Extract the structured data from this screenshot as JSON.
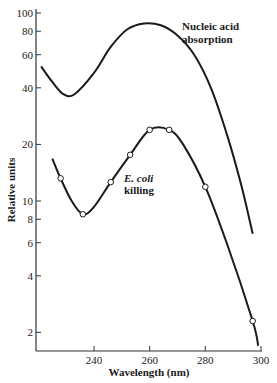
{
  "chart_data": {
    "type": "line",
    "title": "",
    "xlabel": "Wavelength (nm)",
    "ylabel": "Relative units",
    "xscale": "linear",
    "yscale": "log",
    "xlim": [
      219,
      300
    ],
    "ylim": [
      1.6,
      100
    ],
    "grid": false,
    "x_ticks": [
      240,
      260,
      280,
      300
    ],
    "y_ticks": [
      2,
      4,
      6,
      8,
      10,
      20,
      40,
      60,
      80,
      100
    ],
    "series": [
      {
        "name": "Nucleic acid absorption",
        "label_lines": [
          "Nucleic acid",
          "absorption"
        ],
        "markers": false,
        "x": [
          221,
          225,
          229,
          233,
          240,
          246,
          252,
          258,
          264,
          270,
          276,
          282,
          288,
          293,
          297
        ],
        "values": [
          52,
          43,
          37,
          37,
          48,
          66,
          82,
          88,
          86,
          76,
          60,
          40,
          22,
          12,
          6.7
        ]
      },
      {
        "name": "E. coli killing",
        "label_lines": [
          "E. coli",
          "killing"
        ],
        "markers": true,
        "x": [
          225,
          228,
          236,
          246,
          253,
          260,
          267,
          280,
          297
        ],
        "values": [
          16.8,
          13.2,
          8.5,
          12.6,
          17.6,
          23.9,
          23.9,
          11.9,
          2.3
        ],
        "smooth_x": [
          225,
          228,
          232,
          236,
          240,
          246,
          253,
          260,
          267,
          272,
          280,
          288,
          297,
          299
        ],
        "smooth_values": [
          16.8,
          13.2,
          10.0,
          8.5,
          9.3,
          12.6,
          17.6,
          23.9,
          23.9,
          20,
          11.9,
          5.8,
          2.3,
          1.7
        ]
      }
    ]
  }
}
